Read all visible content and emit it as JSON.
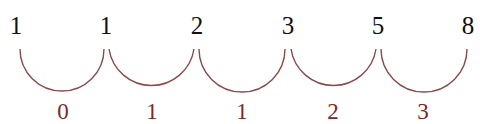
{
  "sequence": {
    "title": "Fibonacci sequence differences",
    "terms": [
      {
        "value": "1",
        "x": 16
      },
      {
        "value": "1",
        "x": 106
      },
      {
        "value": "2",
        "x": 197
      },
      {
        "value": "3",
        "x": 288
      },
      {
        "value": "5",
        "x": 378
      },
      {
        "value": "8",
        "x": 468
      }
    ],
    "differences": [
      {
        "value": "0",
        "x": 63
      },
      {
        "value": "1",
        "x": 152
      },
      {
        "value": "1",
        "x": 242
      },
      {
        "value": "2",
        "x": 333
      },
      {
        "value": "3",
        "x": 423
      }
    ]
  },
  "colors": {
    "terms": "#111111",
    "arcs": "#8b4a4a",
    "differences": "#7a2a2a"
  }
}
